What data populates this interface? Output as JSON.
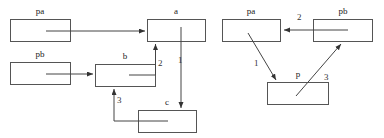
{
  "diagram": {
    "colors": {
      "background": "#ffffff",
      "box_stroke": "#555555",
      "box_fill": "#ffffff",
      "connector": "#444444",
      "text": "#222222"
    },
    "left_graph": {
      "name": "left-graph",
      "boxes": [
        {
          "id": "pa",
          "label": "pa",
          "x": 10,
          "y": 19,
          "w": 60,
          "h": 22,
          "label_x": 40,
          "label_y": 8
        },
        {
          "id": "a",
          "label": "a",
          "x": 147,
          "y": 19,
          "w": 58,
          "h": 22,
          "label_x": 176,
          "label_y": 8
        },
        {
          "id": "pb",
          "label": "pb",
          "x": 10,
          "y": 62,
          "w": 60,
          "h": 22,
          "label_x": 40,
          "label_y": 51
        },
        {
          "id": "b",
          "label": "b",
          "x": 95,
          "y": 64,
          "w": 60,
          "h": 22,
          "label_x": 125,
          "label_y": 53
        },
        {
          "id": "c",
          "label": "c",
          "x": 138,
          "y": 110,
          "w": 58,
          "h": 22,
          "label_x": 167,
          "label_y": 99
        }
      ],
      "edges": [
        {
          "id": "pa-to-a",
          "label": "",
          "from": "pa",
          "to": "a"
        },
        {
          "id": "pb-to-b",
          "label": "",
          "from": "pb",
          "to": "b"
        },
        {
          "id": "b-to-a",
          "label": "2",
          "from": "b",
          "to": "a",
          "label_x": 159,
          "label_y": 60
        },
        {
          "id": "a-to-c",
          "label": "1",
          "from": "a",
          "to": "c",
          "label_x": 180,
          "label_y": 57
        },
        {
          "id": "c-to-b",
          "label": "3",
          "from": "c",
          "to": "b",
          "label_x": 118,
          "label_y": 97
        }
      ]
    },
    "right_graph": {
      "name": "right-graph",
      "boxes": [
        {
          "id": "pa2",
          "label": "pa",
          "x": 222,
          "y": 19,
          "w": 58,
          "h": 22,
          "label_x": 251,
          "label_y": 8
        },
        {
          "id": "pb2",
          "label": "pb",
          "x": 313,
          "y": 19,
          "w": 59,
          "h": 22,
          "label_x": 342,
          "label_y": 8
        },
        {
          "id": "p",
          "label": "p",
          "x": 267,
          "y": 82,
          "w": 61,
          "h": 22,
          "label_x": 297,
          "label_y": 71
        }
      ],
      "edges": [
        {
          "id": "pa-to-p",
          "label": "1",
          "from": "pa2",
          "to": "p",
          "label_x": 255,
          "label_y": 60
        },
        {
          "id": "pb-to-pa",
          "label": "2",
          "from": "pb2",
          "to": "pa2",
          "label_x": 298,
          "label_y": 14
        },
        {
          "id": "p-to-pb",
          "label": "3",
          "from": "p",
          "to": "pb2",
          "label_x": 325,
          "label_y": 74
        }
      ]
    }
  }
}
